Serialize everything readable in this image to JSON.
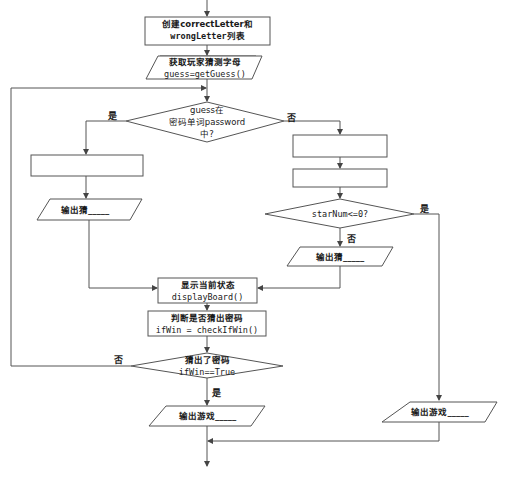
{
  "diagram": {
    "type": "flowchart",
    "nodes": {
      "init": {
        "line1": "创建correctLetter和",
        "line2": "wrongLetter列表"
      },
      "input_guess": {
        "line1": "获取玩家猜测字母",
        "line2": "guess=getGuess()"
      },
      "decision_in_password": {
        "line1": "guess在",
        "line2": "密码单词password",
        "line3": "中?"
      },
      "left_blank_box": {
        "text": ""
      },
      "output_left": {
        "text": "输出猜_____"
      },
      "right_blank_box_1": {
        "text": ""
      },
      "right_blank_box_2": {
        "text": ""
      },
      "decision_starnum": {
        "text": "starNum<=0?"
      },
      "output_right_mid": {
        "text": "输出猜_____"
      },
      "display_board": {
        "line1": "显示当前状态",
        "line2": "displayBoard()"
      },
      "check_win": {
        "line1": "判断是否猜出密码",
        "line2": "ifWin = checkIfWin()"
      },
      "decision_win": {
        "line1": "猜出了密码",
        "line2": "ifWin==True"
      },
      "output_game_left": {
        "text": "输出游戏_____"
      },
      "output_game_right": {
        "text": "输出游戏_____"
      }
    },
    "edge_labels": {
      "in_password_yes": "是",
      "in_password_no": "否",
      "starnum_yes": "是",
      "starnum_no": "否",
      "win_no": "否",
      "win_yes": "是"
    },
    "colors": {
      "stroke": "#555555",
      "text": "#1a1a1a",
      "background": "#ffffff"
    }
  }
}
